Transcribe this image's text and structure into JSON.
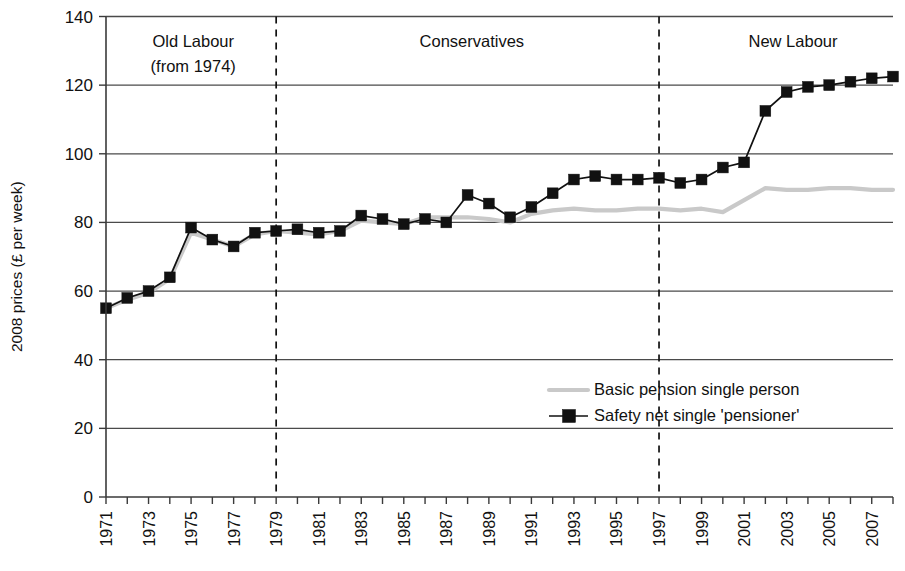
{
  "chart_data": {
    "type": "line",
    "title": "",
    "xlabel": "",
    "ylabel": "2008 prices (£ per week)",
    "ylim": [
      0,
      140
    ],
    "ytick_values": [
      0,
      20,
      40,
      60,
      80,
      100,
      120,
      140
    ],
    "ytick_labels": [
      "0",
      "20",
      "40",
      "60",
      "80",
      "100",
      "120",
      "140"
    ],
    "grid": "horizontal",
    "xlim": [
      1971,
      2008
    ],
    "x": [
      1971,
      1972,
      1973,
      1974,
      1975,
      1976,
      1977,
      1978,
      1979,
      1980,
      1981,
      1982,
      1983,
      1984,
      1985,
      1986,
      1987,
      1988,
      1989,
      1990,
      1991,
      1992,
      1993,
      1994,
      1995,
      1996,
      1997,
      1998,
      1999,
      2000,
      2001,
      2002,
      2003,
      2004,
      2005,
      2006,
      2007,
      2008
    ],
    "xtick_labels": [
      "1971",
      "",
      "1973",
      "",
      "1975",
      "",
      "1977",
      "",
      "1979",
      "",
      "1981",
      "",
      "1983",
      "",
      "1985",
      "",
      "1987",
      "",
      "1989",
      "",
      "1991",
      "",
      "1993",
      "",
      "1995",
      "",
      "1997",
      "",
      "1999",
      "",
      "2001",
      "",
      "2003",
      "",
      "2005",
      "",
      "2007",
      ""
    ],
    "legend_position": "inside-lower-right",
    "series": [
      {
        "name": "Basic pension single person",
        "style": "line",
        "color": "#c9c9c9",
        "marker": "none",
        "values": [
          55.0,
          57.5,
          59.5,
          63.5,
          77.0,
          75.0,
          73.0,
          76.5,
          77.5,
          77.0,
          76.5,
          77.5,
          80.5,
          80.0,
          79.5,
          81.5,
          81.5,
          81.5,
          81.0,
          80.0,
          82.5,
          83.5,
          84.0,
          83.5,
          83.5,
          84.0,
          84.0,
          83.5,
          84.0,
          83.0,
          86.5,
          90.0,
          89.5,
          89.5,
          90.0,
          90.0,
          89.5,
          89.5
        ]
      },
      {
        "name": "Safety net single 'pensioner'",
        "style": "line-marker",
        "color": "#111111",
        "marker": "square",
        "values": [
          55.0,
          58.0,
          60.0,
          64.0,
          78.5,
          75.0,
          73.0,
          77.0,
          77.5,
          78.0,
          77.0,
          77.5,
          82.0,
          81.0,
          79.5,
          81.0,
          80.0,
          88.0,
          85.5,
          81.5,
          84.5,
          88.5,
          92.5,
          93.5,
          92.5,
          92.5,
          93.0,
          91.5,
          92.5,
          96.0,
          97.5,
          112.5,
          118.0,
          119.5,
          120.0,
          121.0,
          122.0,
          122.5
        ]
      }
    ],
    "annotations": [
      {
        "text": "Old Labour",
        "sub": "(from 1974)",
        "x_center": 1975.1,
        "era": "old-labour"
      },
      {
        "text": "Conservatives",
        "sub": "",
        "x_center": 1988.2,
        "era": "conservatives"
      },
      {
        "text": "New Labour",
        "sub": "",
        "x_center": 2003.3,
        "era": "new-labour"
      }
    ],
    "dividers": [
      {
        "x": 1979.0,
        "label": "1979-divider"
      },
      {
        "x": 1997.0,
        "label": "1997-divider"
      }
    ]
  }
}
